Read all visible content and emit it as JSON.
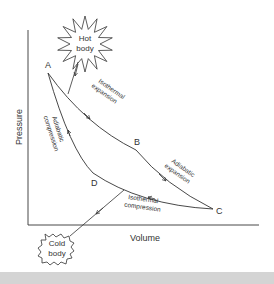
{
  "diagram": {
    "axes": {
      "x_label": "Volume",
      "y_label": "Pressure"
    },
    "reservoirs": {
      "hot": {
        "line1": "Hot",
        "line2": "body"
      },
      "cold": {
        "line1": "Cold",
        "line2": "body"
      }
    },
    "points": [
      "A",
      "B",
      "C",
      "D"
    ],
    "processes": [
      {
        "from": "A",
        "to": "B",
        "line1": "Isothermal",
        "line2": "expansion"
      },
      {
        "from": "B",
        "to": "C",
        "line1": "Adiabatic",
        "line2": "expansion"
      },
      {
        "from": "C",
        "to": "D",
        "line1": "Isothermal",
        "line2": "compression"
      },
      {
        "from": "D",
        "to": "A",
        "line1": "Adiabatic",
        "line2": "compression"
      }
    ],
    "colors": {
      "line": "#333333",
      "text": "#333333",
      "band": "#d4d4d4"
    }
  }
}
